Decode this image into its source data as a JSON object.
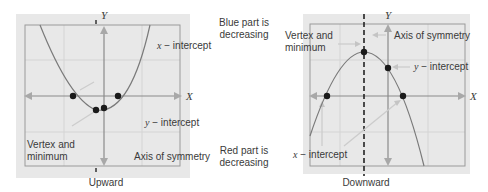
{
  "left_graph": {
    "caption": "Upward",
    "axis_x": "X",
    "axis_y": "Y",
    "labels": {
      "x_intercept_var": "x",
      "x_intercept_text": " − intercept",
      "y_intercept_var": "y",
      "y_intercept_text": " − intercept",
      "vertex_line1": "Vertex and",
      "vertex_line2": "minimum",
      "axis_of_symmetry": "Axis of symmetry"
    }
  },
  "right_graph": {
    "caption": "Downward",
    "axis_x": "X",
    "axis_y": "Y",
    "labels": {
      "vertex_line1": "Vertex and",
      "vertex_line2": "minimum",
      "axis_of_symmetry": "Axis of symmetry",
      "y_intercept_var": "y",
      "y_intercept_text": " − intercept",
      "x_intercept_var": "x",
      "x_intercept_text": " − intercept"
    }
  },
  "middle_notes": {
    "blue_line1": "Blue part is",
    "blue_line2": "decreasing",
    "red_line1": "Red part is",
    "red_line2": "decreasing"
  },
  "colors": {
    "panel_bg": "#e8e8e8",
    "grid": "#d2d2d2",
    "border": "#9a9a9a",
    "axis": "#8a8a8a",
    "curve": "#7a7a7a",
    "point": "#1a1a1a",
    "arrow_hint": "#c4c4c4"
  }
}
